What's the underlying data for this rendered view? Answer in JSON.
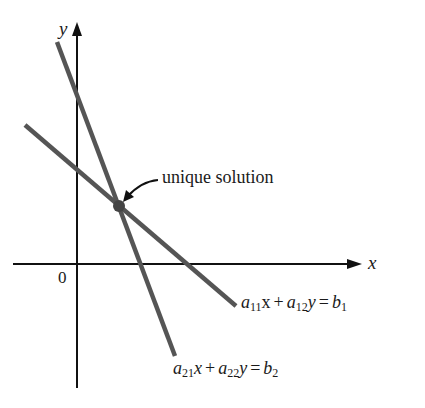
{
  "diagram": {
    "type": "linear-system-graph",
    "axes": {
      "x_label": "x",
      "y_label": "y",
      "origin_label": "0"
    },
    "annotation": {
      "text": "unique solution"
    },
    "equations": [
      {
        "a1_var": "a",
        "a1_sub": "11",
        "x_var": "x",
        "plus": "+",
        "a2_var": "a",
        "a2_sub": "12",
        "y_var": "y",
        "equals": "=",
        "b_var": "b",
        "b_sub": "1"
      },
      {
        "a1_var": "a",
        "a1_sub": "21",
        "x_var": "x",
        "plus": "+",
        "a2_var": "a",
        "a2_sub": "22",
        "y_var": "y",
        "equals": "=",
        "b_var": "b",
        "b_sub": "2"
      }
    ],
    "colors": {
      "axis": "#111111",
      "line": "#555555",
      "point": "#444444"
    }
  }
}
